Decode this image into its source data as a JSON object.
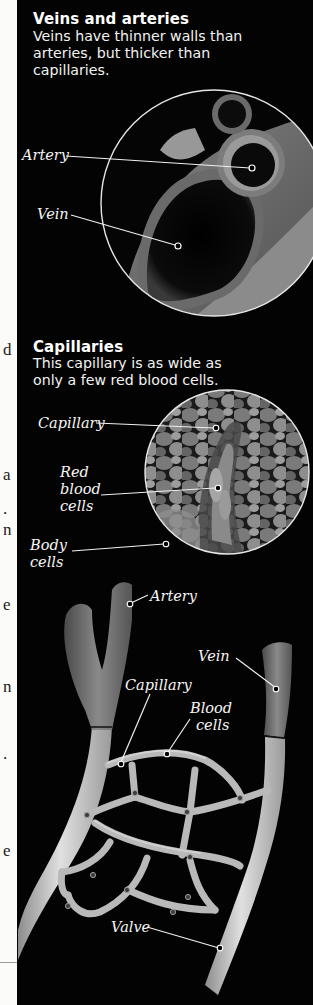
{
  "left_margin": {
    "fragments": [
      {
        "char": "d",
        "top": 341
      },
      {
        "char": "a",
        "top": 466
      },
      {
        "char": ".",
        "top": 500
      },
      {
        "char": "n",
        "top": 521
      },
      {
        "char": "e",
        "top": 596
      },
      {
        "char": "n",
        "top": 678
      },
      {
        "char": ".",
        "top": 745
      },
      {
        "char": "e",
        "top": 842
      }
    ]
  },
  "veins_arteries": {
    "heading": "Veins and arteries",
    "text_lines": [
      "Veins have thinner walls than",
      "arteries, but thicker than",
      "capillaries."
    ],
    "labels": {
      "artery": "Artery",
      "vein": "Vein"
    }
  },
  "capillaries": {
    "heading": "Capillaries",
    "text_lines": [
      "This capillary is as wide as",
      "only a few red blood cells."
    ],
    "labels": {
      "capillary": "Capillary",
      "red_blood_cells_lines": [
        "Red",
        "blood",
        "cells"
      ],
      "body_cells_lines": [
        "Body",
        "cells"
      ]
    }
  },
  "network_diagram": {
    "labels": {
      "artery": "Artery",
      "vein": "Vein",
      "capillary": "Capillary",
      "blood_cells_lines": [
        "Blood",
        "cells"
      ],
      "valve": "Valve"
    }
  },
  "colors": {
    "panel_bg": "#030303",
    "text": "#ffffff",
    "leader_line": "#e8e8e8",
    "vessel_light": "#c9c9c9",
    "vessel_dark": "#6e6e6e"
  }
}
